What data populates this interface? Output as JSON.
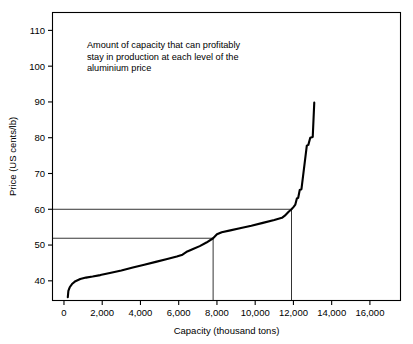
{
  "chart_data": {
    "type": "line",
    "title": "",
    "subtitle": "",
    "xlabel": "Capacity (thousand tons)",
    "ylabel": "Price (US cents/lb)",
    "xlim": [
      -600,
      17600
    ],
    "ylim": [
      34.5,
      115
    ],
    "xticks": [
      0,
      2000,
      4000,
      6000,
      8000,
      10000,
      12000,
      14000,
      16000
    ],
    "xticklabels": [
      "0",
      "2,000",
      "4,000",
      "6,000",
      "8,000",
      "10,000",
      "12,000",
      "14,000",
      "16,000"
    ],
    "yticks": [
      40,
      50,
      60,
      70,
      80,
      90,
      100,
      110
    ],
    "yticklabels": [
      "40",
      "50",
      "60",
      "70",
      "80",
      "90",
      "100",
      "110"
    ],
    "grid": false,
    "legend": null,
    "line_color": "#000000",
    "annotations": [
      {
        "name": "capacity-note",
        "lines": [
          "Amount of capacity that can profitably",
          "stay in production at each level of the",
          "aluminium price"
        ],
        "x": 1200,
        "y": 105
      }
    ],
    "series": [
      {
        "name": "Aluminium capacity cost curve",
        "points": [
          [
            200,
            35.4
          ],
          [
            230,
            37.2
          ],
          [
            300,
            38.2
          ],
          [
            420,
            39.1
          ],
          [
            600,
            39.9
          ],
          [
            850,
            40.5
          ],
          [
            1150,
            40.9
          ],
          [
            1500,
            41.2
          ],
          [
            1900,
            41.6
          ],
          [
            2400,
            42.2
          ],
          [
            3000,
            42.9
          ],
          [
            3600,
            43.7
          ],
          [
            4200,
            44.5
          ],
          [
            4800,
            45.3
          ],
          [
            5400,
            46.1
          ],
          [
            5900,
            46.8
          ],
          [
            6200,
            47.3
          ],
          [
            6450,
            48.2
          ],
          [
            6750,
            48.9
          ],
          [
            7100,
            49.7
          ],
          [
            7450,
            50.7
          ],
          [
            7800,
            51.9
          ],
          [
            8000,
            53.0
          ],
          [
            8250,
            53.6
          ],
          [
            8700,
            54.1
          ],
          [
            9200,
            54.7
          ],
          [
            9800,
            55.4
          ],
          [
            10400,
            56.2
          ],
          [
            11000,
            57.0
          ],
          [
            11400,
            57.6
          ],
          [
            11550,
            58.2
          ],
          [
            11750,
            59.3
          ],
          [
            11900,
            60.0
          ],
          [
            12000,
            60.6
          ],
          [
            12100,
            61.3
          ],
          [
            12180,
            63.0
          ],
          [
            12250,
            63.2
          ],
          [
            12330,
            65.4
          ],
          [
            12420,
            65.6
          ],
          [
            12700,
            77.8
          ],
          [
            12780,
            78.0
          ],
          [
            12880,
            80.0
          ],
          [
            13010,
            80.2
          ],
          [
            13090,
            89.8
          ]
        ]
      }
    ],
    "reference_lines": [
      {
        "name": "price-60-guide",
        "orientation": "horizontal",
        "value": 60,
        "x_from": -600,
        "x_to": 11900
      },
      {
        "name": "price-52-guide",
        "orientation": "horizontal",
        "value": 51.9,
        "x_from": -600,
        "x_to": 7800
      },
      {
        "name": "capacity-11900-guide",
        "orientation": "vertical",
        "value": 11900,
        "y_from": 34.5,
        "y_to": 60
      },
      {
        "name": "capacity-7800-guide",
        "orientation": "vertical",
        "value": 7800,
        "y_from": 34.5,
        "y_to": 51.9
      }
    ]
  }
}
